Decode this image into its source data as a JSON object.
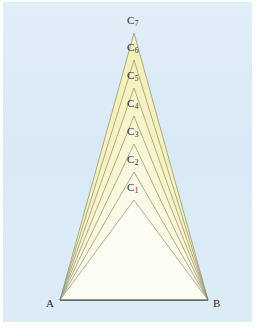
{
  "figure": {
    "type": "geometry-diagram",
    "panel_color": "#dcecf7",
    "page_color": "#ffffff",
    "stroke_color": "#7a7a5e",
    "base_stroke_color": "#55555a",
    "base": {
      "left_vertex_label": "A",
      "right_vertex_label": "B",
      "left_vertex": {
        "x": 60,
        "y": 300
      },
      "right_vertex": {
        "x": 208,
        "y": 300
      }
    },
    "apex_x": 134,
    "apexes": [
      {
        "label": "C",
        "subscript": "1",
        "x": 134,
        "y": 200,
        "fill": "#fdfdf4"
      },
      {
        "label": "C",
        "subscript": "2",
        "x": 134,
        "y": 172,
        "fill": "#fbfae6"
      },
      {
        "label": "C",
        "subscript": "3",
        "x": 134,
        "y": 144,
        "fill": "#faf8dd"
      },
      {
        "label": "C",
        "subscript": "4",
        "x": 134,
        "y": 116,
        "fill": "#f9f6d4"
      },
      {
        "label": "C",
        "subscript": "5",
        "x": 134,
        "y": 88,
        "fill": "#f8f4cb"
      },
      {
        "label": "C",
        "subscript": "6",
        "x": 134,
        "y": 60,
        "fill": "#f7f2c2"
      },
      {
        "label": "C",
        "subscript": "7",
        "x": 134,
        "y": 33,
        "fill": "#f6f0b9"
      }
    ],
    "labels": [
      {
        "text": "C",
        "sub": "1",
        "x": 127,
        "y": 181
      },
      {
        "text": "C",
        "sub": "2",
        "x": 127,
        "y": 153
      },
      {
        "text": "C",
        "sub": "3",
        "x": 127,
        "y": 125
      },
      {
        "text": "C",
        "sub": "4",
        "x": 127,
        "y": 97
      },
      {
        "text": "C",
        "sub": "5",
        "x": 127,
        "y": 69
      },
      {
        "text": "C",
        "sub": "6",
        "x": 127,
        "y": 41
      },
      {
        "text": "C",
        "sub": "7",
        "x": 127,
        "y": 14
      }
    ],
    "base_labels": [
      {
        "text": "A",
        "x": 46,
        "y": 297
      },
      {
        "text": "B",
        "x": 213,
        "y": 297
      }
    ]
  }
}
